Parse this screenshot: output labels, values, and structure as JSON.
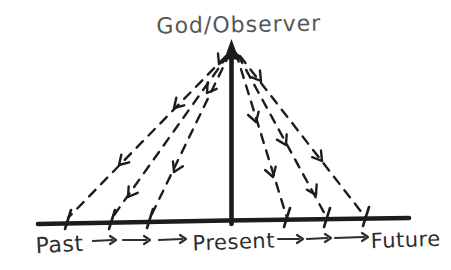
{
  "title": "God/Observer",
  "timeline": {
    "past": "Past",
    "present": "Present",
    "future": "Future"
  },
  "colors": {
    "background": "#ffffff",
    "ink": "#1c1c1c",
    "title_text": "#575757",
    "label_text": "#2e2e2e"
  },
  "structure": {
    "dashed_rays_left": 3,
    "dashed_rays_right": 3,
    "arrowheads_per_ray": 2,
    "flow_arrows_left": 3,
    "flow_arrows_right": 3
  }
}
